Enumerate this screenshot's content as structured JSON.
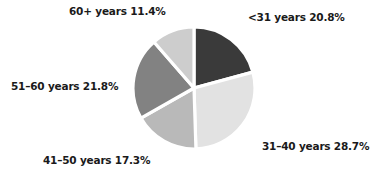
{
  "chart_data": {
    "type": "pie",
    "title": "",
    "subtitle": "",
    "xlabel": "",
    "ylabel": "",
    "legend_position": "none",
    "grid": false,
    "start_angle_deg": 0,
    "direction": "clockwise",
    "categories": [
      "<31 years",
      "31–40 years",
      "41–50 years",
      "51–60 years",
      "60+ years"
    ],
    "values": [
      20.8,
      28.7,
      17.3,
      21.8,
      11.4
    ],
    "value_unit": "%",
    "slices": [
      {
        "name": "lt-31",
        "category": "<31 years",
        "value": 20.8,
        "value_text": "20.8%",
        "label": "<31 years  20.8%",
        "color": "#3a3a3a",
        "start_deg": 0,
        "end_deg": 74.88
      },
      {
        "name": "31-40",
        "category": "31–40 years",
        "value": 28.7,
        "value_text": "28.7%",
        "label": "31–40 years 28.7%",
        "color": "#e2e2e2",
        "start_deg": 74.88,
        "end_deg": 178.2
      },
      {
        "name": "41-50",
        "category": "41–50 years",
        "value": 17.3,
        "value_text": "17.3%",
        "label": "41–50 years  17.3%",
        "color": "#b9b9b9",
        "start_deg": 178.2,
        "end_deg": 240.48
      },
      {
        "name": "51-60",
        "category": "51–60 years",
        "value": 21.8,
        "value_text": "21.8%",
        "label": "51–60 years  21.8%",
        "color": "#828282",
        "start_deg": 240.48,
        "end_deg": 319.0
      },
      {
        "name": "60-plus",
        "category": "60+ years",
        "value": 11.4,
        "value_text": "11.4%",
        "label": "60+ years  11.4%",
        "color": "#cdcdcd",
        "start_deg": 319.0,
        "end_deg": 360.0
      }
    ],
    "colors": {
      "background": "#ffffff",
      "separator": "#ffffff",
      "label_text": "#1a1a1a"
    }
  }
}
